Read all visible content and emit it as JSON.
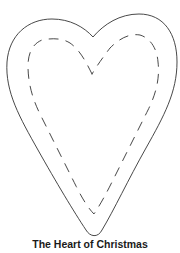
{
  "figure": {
    "title": "The Heart of Christmas",
    "shape": "heart-pattern",
    "outline_style": "solid",
    "stitch_style": "dashed",
    "colors": {
      "background": "#ffffff",
      "outline": "#333333",
      "stitch": "#333333",
      "caption": "#1a1a1a"
    }
  }
}
